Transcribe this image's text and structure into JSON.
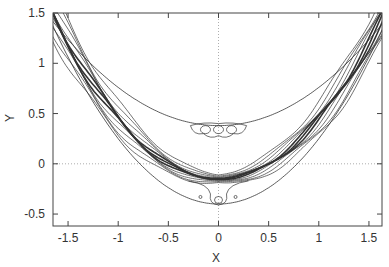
{
  "chart_data": {
    "type": "contour",
    "title": "",
    "xlabel": "X",
    "ylabel": "Y",
    "xlim": [
      -1.65,
      1.63
    ],
    "ylim": [
      -0.62,
      1.5
    ],
    "xticks": [
      "-1.5",
      "-1",
      "-0.5",
      "0",
      "0.5",
      "1",
      "1.5"
    ],
    "yticks": [
      "-0.5",
      "0",
      "0.5",
      "1",
      "1.5"
    ],
    "xtick_values": [
      -1.5,
      -1,
      -0.5,
      0,
      0.5,
      1,
      1.5
    ],
    "ytick_values": [
      -0.5,
      0,
      0.5,
      1,
      1.5
    ],
    "grid": false,
    "zero_lines": {
      "x0": true,
      "y0": true,
      "style": "dotted"
    },
    "legend": null,
    "series": [
      {
        "name": "outer-upper-boundary",
        "shape": "parabola",
        "vertex": [
          0,
          0.38
        ],
        "a": 0.38
      },
      {
        "name": "outer-lower-boundary",
        "shape": "parabola",
        "vertex": [
          0,
          -0.4
        ],
        "a": 0.65
      },
      {
        "name": "contour-band",
        "shape": "parabola",
        "vertex": [
          0,
          -0.15
        ],
        "a": 0.6,
        "levels": 10,
        "description": "dense wiggly contour lines along a parabolic valley, thickest at center"
      },
      {
        "name": "upper-island",
        "center": [
          0,
          0.35
        ],
        "description": "small closed contours with three loops near (0, 0.35)"
      },
      {
        "name": "lower-islands",
        "centers": [
          [
            -0.18,
            -0.33
          ],
          [
            0,
            -0.37
          ],
          [
            0.17,
            -0.33
          ]
        ],
        "description": "small closed contours below the valley floor"
      }
    ]
  }
}
